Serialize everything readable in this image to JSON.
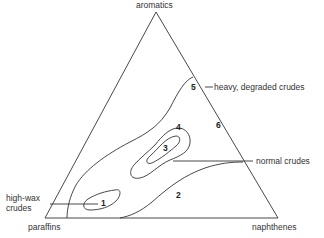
{
  "diagram": {
    "type": "ternary",
    "vertices": {
      "top": "aromatics",
      "bottom_left": "paraffins",
      "bottom_right": "naphthenes"
    },
    "curve_numbers": [
      "1",
      "2",
      "3",
      "4",
      "5",
      "6"
    ],
    "annotations": {
      "heavy": "heavy, degraded crudes",
      "normal": "normal crudes",
      "highwax_line1": "high-wax",
      "highwax_line2": "crudes"
    },
    "line_color": "#333333"
  }
}
